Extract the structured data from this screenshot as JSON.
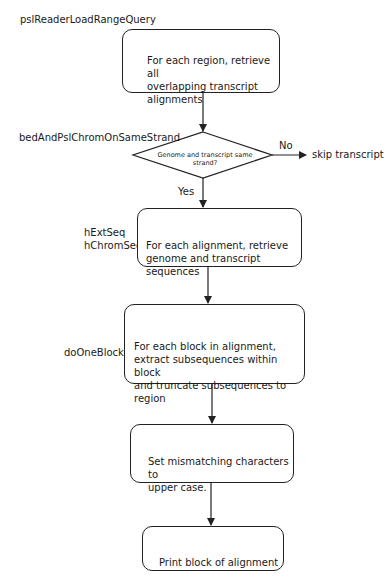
{
  "diagram": {
    "type": "flowchart",
    "function_labels": {
      "box1": "pslReaderLoadRangeQuery",
      "decision": "bedAndPslChromOnSameStrand",
      "box2": "hExtSeq\nhChromSeq",
      "box3": "doOneBlock"
    },
    "nodes": [
      {
        "id": "box1",
        "shape": "rounded-rect",
        "text": "For each region, retrieve all\noverlapping transcript\nalignments"
      },
      {
        "id": "decision",
        "shape": "diamond",
        "text": "Genome and transcript same strand?"
      },
      {
        "id": "skip",
        "shape": "text",
        "text": "skip transcript"
      },
      {
        "id": "box2",
        "shape": "rounded-rect",
        "text": "For each alignment, retrieve\ngenome and transcript sequences"
      },
      {
        "id": "box3",
        "shape": "rounded-rect",
        "text": "For each block in alignment,\nextract subsequences within block\nand truncate subsequences to region"
      },
      {
        "id": "box4",
        "shape": "rounded-rect",
        "text": "Set mismatching characters to\nupper case."
      },
      {
        "id": "box5",
        "shape": "rounded-rect",
        "text": "Print block of alignment"
      }
    ],
    "edges": [
      {
        "from": "box1",
        "to": "decision",
        "label": ""
      },
      {
        "from": "decision",
        "to": "skip",
        "label": "No"
      },
      {
        "from": "decision",
        "to": "box2",
        "label": "Yes"
      },
      {
        "from": "box2",
        "to": "box3",
        "label": ""
      },
      {
        "from": "box3",
        "to": "box4",
        "label": ""
      },
      {
        "from": "box4",
        "to": "box5",
        "label": ""
      }
    ],
    "edge_labels": {
      "no": "No",
      "yes": "Yes"
    }
  }
}
